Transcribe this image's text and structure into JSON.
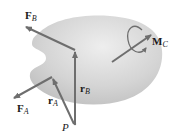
{
  "diagram": {
    "type": "rigid-body-free-body-diagram",
    "colors": {
      "body_fill": "#c8c8c8",
      "body_fill_light": "#e6e6e6",
      "vector": "#6e6e6e",
      "text": "#1a1a1a"
    },
    "labels": {
      "force_b": {
        "symbol": "F",
        "subscript": "B"
      },
      "force_a": {
        "symbol": "F",
        "subscript": "A"
      },
      "position_b": {
        "symbol": "r",
        "subscript": "B"
      },
      "position_a": {
        "symbol": "r",
        "subscript": "A"
      },
      "moment_c": {
        "symbol": "M",
        "subscript": "C"
      },
      "point_p": "P"
    }
  }
}
